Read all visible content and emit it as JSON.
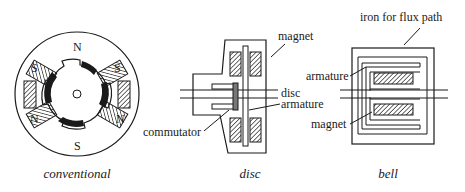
{
  "figure": {
    "panels": [
      {
        "id": "conventional",
        "caption": "conventional",
        "pole_labels": [
          "N",
          "S",
          "S",
          "N",
          "N",
          "S"
        ],
        "labels": []
      },
      {
        "id": "disc",
        "caption": "disc",
        "labels": {
          "magnet": "magnet",
          "disc": "disc",
          "armature": "armature",
          "commutator": "commutator"
        }
      },
      {
        "id": "bell",
        "caption": "bell",
        "labels": {
          "iron": "iron for flux path",
          "armature": "armature",
          "magnet": "magnet"
        }
      }
    ],
    "colors": {
      "ink": "#1a1a1a",
      "background": "#ffffff"
    }
  }
}
